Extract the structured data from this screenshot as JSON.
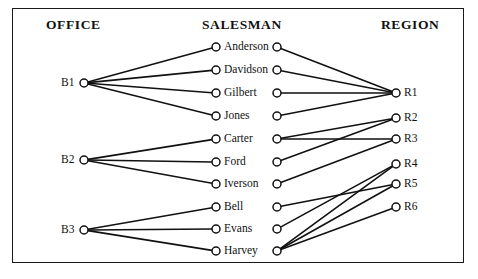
{
  "diagram": {
    "type": "tripartite-graph",
    "columns": [
      {
        "id": "office",
        "title": "OFFICE"
      },
      {
        "id": "salesman",
        "title": "SALESMAN"
      },
      {
        "id": "region",
        "title": "REGION"
      }
    ],
    "offices": [
      {
        "id": "B1",
        "label": "B1",
        "x": 84,
        "y": 83
      },
      {
        "id": "B2",
        "label": "B2",
        "x": 84,
        "y": 160
      },
      {
        "id": "B3",
        "label": "B3",
        "x": 84,
        "y": 230
      }
    ],
    "salesmen": [
      {
        "id": "anderson",
        "label": "Anderson",
        "left_x": 216,
        "right_x": 277,
        "y": 47
      },
      {
        "id": "davidson",
        "label": "Davidson",
        "left_x": 216,
        "right_x": 277,
        "y": 70
      },
      {
        "id": "gilbert",
        "label": "Gilbert",
        "left_x": 216,
        "right_x": 277,
        "y": 93
      },
      {
        "id": "jones",
        "label": "Jones",
        "left_x": 216,
        "right_x": 277,
        "y": 116
      },
      {
        "id": "carter",
        "label": "Carter",
        "left_x": 216,
        "right_x": 277,
        "y": 139
      },
      {
        "id": "ford",
        "label": "Ford",
        "left_x": 216,
        "right_x": 277,
        "y": 162
      },
      {
        "id": "iverson",
        "label": "Iverson",
        "left_x": 216,
        "right_x": 277,
        "y": 184
      },
      {
        "id": "bell",
        "label": "Bell",
        "left_x": 216,
        "right_x": 277,
        "y": 207
      },
      {
        "id": "evans",
        "label": "Evans",
        "left_x": 216,
        "right_x": 277,
        "y": 229
      },
      {
        "id": "harvey",
        "label": "Harvey",
        "left_x": 216,
        "right_x": 277,
        "y": 251
      }
    ],
    "regions": [
      {
        "id": "R1",
        "label": "R1",
        "x": 396,
        "y": 93
      },
      {
        "id": "R2",
        "label": "R2",
        "x": 396,
        "y": 118
      },
      {
        "id": "R3",
        "label": "R3",
        "x": 396,
        "y": 139
      },
      {
        "id": "R4",
        "label": "R4",
        "x": 396,
        "y": 164
      },
      {
        "id": "R5",
        "label": "R5",
        "x": 396,
        "y": 184
      },
      {
        "id": "R6",
        "label": "R6",
        "x": 396,
        "y": 207
      }
    ],
    "office_salesman_edges": [
      {
        "from": "B1",
        "to": "anderson"
      },
      {
        "from": "B1",
        "to": "davidson"
      },
      {
        "from": "B1",
        "to": "gilbert"
      },
      {
        "from": "B1",
        "to": "jones"
      },
      {
        "from": "B2",
        "to": "carter"
      },
      {
        "from": "B2",
        "to": "ford"
      },
      {
        "from": "B2",
        "to": "iverson"
      },
      {
        "from": "B3",
        "to": "bell"
      },
      {
        "from": "B3",
        "to": "evans"
      },
      {
        "from": "B3",
        "to": "harvey"
      }
    ],
    "salesman_region_edges": [
      {
        "from": "anderson",
        "to": "R1"
      },
      {
        "from": "davidson",
        "to": "R1"
      },
      {
        "from": "gilbert",
        "to": "R1"
      },
      {
        "from": "jones",
        "to": "R1"
      },
      {
        "from": "carter",
        "to": "R2"
      },
      {
        "from": "carter",
        "to": "R3"
      },
      {
        "from": "ford",
        "to": "R2"
      },
      {
        "from": "iverson",
        "to": "R3"
      },
      {
        "from": "bell",
        "to": "R5"
      },
      {
        "from": "evans",
        "to": "R4"
      },
      {
        "from": "harvey",
        "to": "R4"
      },
      {
        "from": "harvey",
        "to": "R5"
      },
      {
        "from": "harvey",
        "to": "R6"
      }
    ],
    "style": {
      "line_color": "#111111",
      "node_stroke": "#111111",
      "node_fill": "#ffffff",
      "border_color": "#1a1a1a",
      "background": "#ffffff",
      "node_radius": 4,
      "line_width": 1.6
    }
  }
}
